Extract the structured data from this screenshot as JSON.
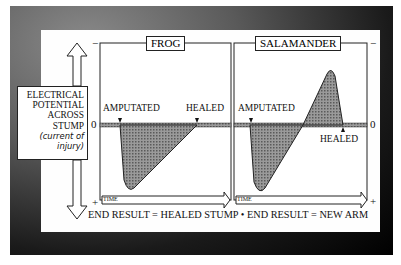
{
  "diagram": {
    "y_axis_label": {
      "lines": [
        "ELECTRICAL",
        "POTENTIAL",
        "ACROSS",
        "STUMP"
      ],
      "sublines": [
        "(current of",
        "injury)"
      ]
    },
    "axis_marks": {
      "top": "−",
      "zero": "0",
      "bottom": "+"
    },
    "panels": [
      {
        "title": "FROG",
        "events": {
          "start": "AMPUTATED",
          "end": "HEALED"
        },
        "time_label": "TIME",
        "curve": "drops sharply negative after amputation, returns linearly to zero at healing",
        "result": "END RESULT = HEALED STUMP"
      },
      {
        "title": "SALAMANDER",
        "events": {
          "start": "AMPUTATED",
          "end": "HEALED"
        },
        "time_label": "TIME",
        "curve": "drops sharply negative after amputation, overshoots to positive peak, returns to zero at healing",
        "result": "END RESULT = NEW ARM"
      }
    ],
    "separator": "•",
    "footer": "END RESULT = HEALED STUMP • END RESULT = NEW ARM",
    "colors": {
      "frame": "#1a1a1a",
      "fill": "#8c8c8c",
      "line": "#222222"
    }
  }
}
